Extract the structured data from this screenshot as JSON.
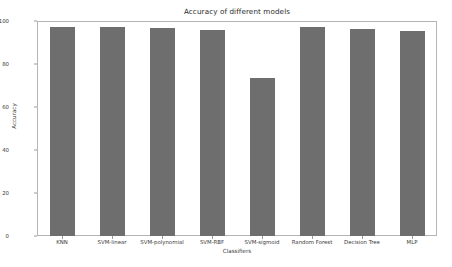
{
  "chart_data": {
    "type": "bar",
    "title": "Accuracy of different models",
    "xlabel": "Classifiers",
    "ylabel": "Accuracy",
    "categories": [
      "KNN",
      "SVM-linear",
      "SVM-polynomial",
      "SVM-RBF",
      "SVM-sigmoid",
      "Random Forest",
      "Decision Tree",
      "MLP"
    ],
    "values": [
      97.2,
      97.3,
      96.9,
      95.6,
      73.6,
      97.0,
      96.5,
      95.4
    ],
    "ylim": [
      0,
      100
    ],
    "yticks": [
      0,
      20,
      40,
      60,
      80,
      100
    ],
    "ytick_labels": [
      "0",
      "20",
      "40",
      "60",
      "80",
      "100"
    ],
    "grid": false,
    "legend": null,
    "bar_color": "#6e6e6e",
    "frame_color": "#b5b5b5",
    "background": "#ffffff"
  }
}
